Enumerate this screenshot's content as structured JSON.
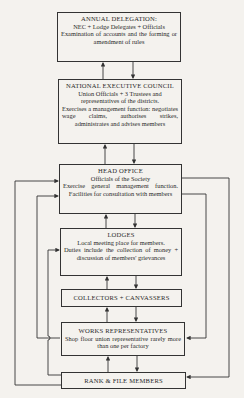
{
  "diagram": {
    "boxes": [
      {
        "id": "annual-delegation",
        "title": "ANNUAL DELEGATION:",
        "subtitle": "NEC + Lodge Delegates + Officials",
        "body": "Examination of accounts and the forming or amendment of rules"
      },
      {
        "id": "national-executive-council",
        "title": "NATIONAL EXECUTIVE COUNCIL",
        "subtitle": "Union Officials + 3 Trustees and representatives of the districts.",
        "body": "Exercises a management function: negotiates wage claims, authorises strikes, administrates and advises members"
      },
      {
        "id": "head-office",
        "title": "HEAD OFFICE",
        "subtitle": "Officials of the Society",
        "body": "Exercise general management function. Facilities for consultation with members"
      },
      {
        "id": "lodges",
        "title": "LODGES",
        "subtitle": "Local meeting place for members.",
        "body": "Duties include the collection of money + discussion of members' grievances"
      },
      {
        "id": "collectors-canvassers",
        "title": "COLLECTORS + CANVASSERS"
      },
      {
        "id": "works-representatives",
        "title": "WORKS REPRESENTATIVES",
        "body": "Shop floor union representative rarely more than one per factory"
      },
      {
        "id": "rank-file-members",
        "title": "RANK & FILE MEMBERS"
      }
    ],
    "colors": {
      "line": "#333333",
      "background": "#f4f2ee",
      "text": "#2a2a2a"
    }
  }
}
